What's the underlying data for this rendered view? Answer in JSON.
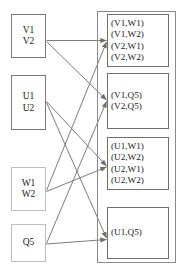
{
  "diagram": {
    "colors": {
      "edge": "#6e6e6c",
      "border_dark": "#7a7a78",
      "border_light": "#bdbdbb",
      "group_border": "#8a8a88",
      "result_border": "#6f6f6d",
      "text": "#1a1a1a",
      "background": "#ffffff"
    },
    "inputs": [
      {
        "id": "v",
        "lines": [
          "V1",
          "V2"
        ],
        "style": "dark"
      },
      {
        "id": "u",
        "lines": [
          "U1",
          "U2"
        ],
        "style": "dark"
      },
      {
        "id": "w",
        "lines": [
          "W1",
          "W2"
        ],
        "style": "light"
      },
      {
        "id": "q",
        "lines": [
          "Q5"
        ],
        "style": "light"
      }
    ],
    "results": [
      {
        "id": "r1",
        "lines": [
          "(V1,W1)",
          "(V1,W2)",
          "(V2,W1)",
          "(V2,W2)"
        ]
      },
      {
        "id": "r2",
        "lines": [
          "(V1,Q5)",
          "(V2,Q5)"
        ]
      },
      {
        "id": "r3",
        "lines": [
          "(U1,W1)",
          "(U2,W2)",
          "(U2,W1)",
          "(U2,W2)"
        ]
      },
      {
        "id": "r4",
        "lines": [
          "(U1,Q5)"
        ]
      }
    ],
    "edges": [
      {
        "from": "v",
        "to": "r1"
      },
      {
        "from": "v",
        "to": "r2"
      },
      {
        "from": "u",
        "to": "r3"
      },
      {
        "from": "u",
        "to": "r4"
      },
      {
        "from": "w",
        "to": "r1"
      },
      {
        "from": "w",
        "to": "r3"
      },
      {
        "from": "q",
        "to": "r2"
      },
      {
        "from": "q",
        "to": "r4"
      }
    ]
  }
}
